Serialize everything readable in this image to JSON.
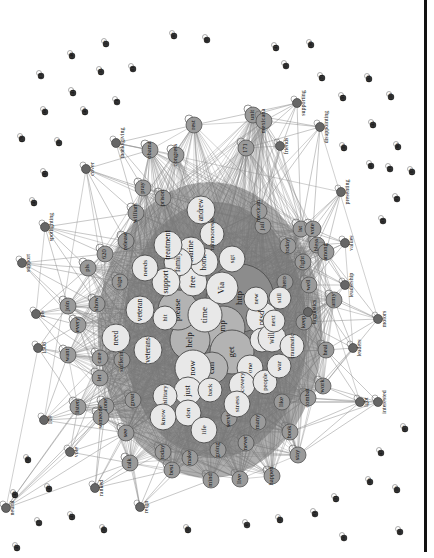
{
  "diagram": {
    "type": "word co-occurrence network",
    "orientation": "rotated 90deg (labels read bottom-to-top)",
    "colors": {
      "edge": "#8a8a8a",
      "hub_dark": "#8c8c8c",
      "hub_mid": "#b3b3b3",
      "light": "#e8e8e8",
      "small": "#9a9a9a",
      "text": "#111111",
      "border": "#111111"
    },
    "core_nodes": [
      {
        "label": "http",
        "x": 240,
        "y": 298,
        "r": 34,
        "shade": "hub_dark"
      },
      {
        "label": "amp",
        "x": 223,
        "y": 328,
        "r": 22,
        "shade": "hub_mid"
      },
      {
        "label": "get",
        "x": 232,
        "y": 352,
        "r": 22,
        "shade": "hub_mid"
      },
      {
        "label": "help",
        "x": 190,
        "y": 340,
        "r": 20,
        "shade": "hub_mid"
      },
      {
        "label": "please",
        "x": 178,
        "y": 310,
        "r": 20,
        "shade": "hub_mid"
      },
      {
        "label": "can",
        "x": 212,
        "y": 368,
        "r": 16,
        "shade": "hub_mid"
      },
      {
        "label": "now",
        "x": 193,
        "y": 368,
        "r": 18,
        "shade": "light"
      },
      {
        "label": "time",
        "x": 205,
        "y": 315,
        "r": 17,
        "shade": "light"
      },
      {
        "label": "Via",
        "x": 222,
        "y": 288,
        "r": 16,
        "shade": "light"
      },
      {
        "label": "free",
        "x": 193,
        "y": 282,
        "r": 14,
        "shade": "light"
      },
      {
        "label": "home",
        "x": 204,
        "y": 262,
        "r": 14,
        "shade": "light"
      },
      {
        "label": "marine",
        "x": 191,
        "y": 251,
        "r": 14,
        "shade": "light"
      },
      {
        "label": "family",
        "x": 178,
        "y": 262,
        "r": 14,
        "shade": "light"
      },
      {
        "label": "support",
        "x": 166,
        "y": 282,
        "r": 14,
        "shade": "light"
      },
      {
        "label": "treatment",
        "x": 168,
        "y": 245,
        "r": 14,
        "shade": "light"
      },
      {
        "label": "andrew",
        "x": 201,
        "y": 210,
        "r": 14,
        "shade": "light"
      },
      {
        "label": "tahmooressi",
        "x": 212,
        "y": 234,
        "r": 12,
        "shade": "light"
      },
      {
        "label": "sgt",
        "x": 232,
        "y": 259,
        "r": 13,
        "shade": "light"
      },
      {
        "label": "hit",
        "x": 165,
        "y": 318,
        "r": 12,
        "shade": "light"
      },
      {
        "label": "veteran",
        "x": 140,
        "y": 310,
        "r": 14,
        "shade": "light"
      },
      {
        "label": "needs",
        "x": 145,
        "y": 268,
        "r": 13,
        "shade": "light"
      },
      {
        "label": "need",
        "x": 116,
        "y": 338,
        "r": 14,
        "shade": "light"
      },
      {
        "label": "veterans",
        "x": 148,
        "y": 350,
        "r": 14,
        "shade": "light"
      },
      {
        "label": "ptsd",
        "x": 262,
        "y": 318,
        "r": 16,
        "shade": "light"
      },
      {
        "label": "new",
        "x": 256,
        "y": 299,
        "r": 12,
        "shade": "light"
      },
      {
        "label": "day",
        "x": 262,
        "y": 340,
        "r": 12,
        "shade": "light"
      },
      {
        "label": "will",
        "x": 272,
        "y": 338,
        "r": 14,
        "shade": "light"
      },
      {
        "label": "one",
        "x": 250,
        "y": 368,
        "r": 13,
        "shade": "light"
      },
      {
        "label": "recovery",
        "x": 242,
        "y": 385,
        "r": 13,
        "shade": "light"
      },
      {
        "label": "just",
        "x": 188,
        "y": 391,
        "r": 14,
        "shade": "light"
      },
      {
        "label": "back",
        "x": 210,
        "y": 390,
        "r": 12,
        "shade": "light"
      },
      {
        "label": "military",
        "x": 165,
        "y": 396,
        "r": 12,
        "shade": "light"
      },
      {
        "label": "don",
        "x": 188,
        "y": 413,
        "r": 13,
        "shade": "light"
      },
      {
        "label": "know",
        "x": 163,
        "y": 417,
        "r": 13,
        "shade": "light"
      },
      {
        "label": "life",
        "x": 204,
        "y": 430,
        "r": 13,
        "shade": "light"
      },
      {
        "label": "stress",
        "x": 237,
        "y": 404,
        "r": 13,
        "shade": "light"
      },
      {
        "label": "people",
        "x": 265,
        "y": 382,
        "r": 12,
        "shade": "light"
      },
      {
        "label": "war",
        "x": 279,
        "y": 366,
        "r": 12,
        "shade": "light"
      },
      {
        "label": "next",
        "x": 274,
        "y": 321,
        "r": 11,
        "shade": "light"
      },
      {
        "label": "still",
        "x": 280,
        "y": 298,
        "r": 11,
        "shade": "light"
      },
      {
        "label": "traumatic",
        "x": 292,
        "y": 346,
        "r": 12,
        "shade": "light"
      }
    ],
    "ring_nodes": [
      {
        "label": "suffering",
        "x": 122,
        "y": 360
      },
      {
        "label": "care",
        "x": 100,
        "y": 358
      },
      {
        "label": "let",
        "x": 100,
        "y": 378
      },
      {
        "label": "great",
        "x": 133,
        "y": 400
      },
      {
        "label": "alone",
        "x": 106,
        "y": 406
      },
      {
        "label": "someone",
        "x": 101,
        "y": 417
      },
      {
        "label": "see",
        "x": 126,
        "y": 433
      },
      {
        "label": "today",
        "x": 163,
        "y": 452
      },
      {
        "label": "best",
        "x": 172,
        "y": 470
      },
      {
        "label": "make",
        "x": 190,
        "y": 458
      },
      {
        "label": "going",
        "x": 218,
        "y": 450
      },
      {
        "label": "never",
        "x": 246,
        "y": 443
      },
      {
        "label": "service",
        "x": 229,
        "y": 418
      },
      {
        "label": "many",
        "x": 258,
        "y": 422
      },
      {
        "label": "like",
        "x": 282,
        "y": 402
      },
      {
        "label": "book",
        "x": 290,
        "y": 432
      },
      {
        "label": "combat",
        "x": 308,
        "y": 398
      },
      {
        "label": "work",
        "x": 323,
        "y": 386
      },
      {
        "label": "keep",
        "x": 304,
        "y": 322
      },
      {
        "label": "well",
        "x": 309,
        "y": 285
      },
      {
        "label": "fight",
        "x": 303,
        "y": 262
      },
      {
        "label": "hero",
        "x": 285,
        "y": 282
      },
      {
        "label": "today",
        "x": 288,
        "y": 246
      },
      {
        "label": "ist",
        "x": 301,
        "y": 229
      },
      {
        "label": "jail",
        "x": 263,
        "y": 226
      },
      {
        "label": "mexican",
        "x": 259,
        "y": 211
      },
      {
        "label": "prison",
        "x": 163,
        "y": 198
      },
      {
        "label": "pray",
        "x": 143,
        "y": 188
      },
      {
        "label": "william",
        "x": 136,
        "y": 213
      },
      {
        "label": "release",
        "x": 126,
        "y": 241
      },
      {
        "label": "620",
        "x": 105,
        "y": 254
      },
      {
        "label": "pls",
        "x": 88,
        "y": 268
      },
      {
        "label": "sign",
        "x": 120,
        "y": 282
      },
      {
        "label": "show",
        "x": 97,
        "y": 304
      },
      {
        "label": "join",
        "x": 68,
        "y": 306
      },
      {
        "label": "every",
        "x": 78,
        "y": 325
      },
      {
        "label": "want",
        "x": 68,
        "y": 355
      },
      {
        "label": "listen",
        "x": 78,
        "y": 407
      },
      {
        "label": "talk",
        "x": 130,
        "y": 463
      },
      {
        "label": "mind",
        "x": 211,
        "y": 480
      },
      {
        "label": "live",
        "x": 240,
        "y": 479
      },
      {
        "label": "happen",
        "x": 272,
        "y": 476
      },
      {
        "label": "stay",
        "x": 298,
        "y": 455
      },
      {
        "label": "heal",
        "x": 326,
        "y": 350
      },
      {
        "label": "army",
        "x": 334,
        "y": 300
      },
      {
        "label": "bless",
        "x": 317,
        "y": 245
      },
      {
        "label": "vote",
        "x": 313,
        "y": 229
      },
      {
        "label": "among",
        "x": 326,
        "y": 252
      },
      {
        "label": "congress",
        "x": 176,
        "y": 155
      },
      {
        "label": "obama",
        "x": 150,
        "y": 150
      },
      {
        "label": "171",
        "x": 246,
        "y": 148
      },
      {
        "label": "unit",
        "x": 253,
        "y": 115
      },
      {
        "label": "rest",
        "x": 194,
        "y": 125
      },
      {
        "label": "mexicana",
        "x": 264,
        "y": 121
      }
    ],
    "outer_nodes": [
      {
        "label": "thanksgiving",
        "x": 116,
        "y": 143
      },
      {
        "label": "cover",
        "x": 86,
        "y": 169
      },
      {
        "label": "spotlighting",
        "x": 45,
        "y": 227
      },
      {
        "label": "support",
        "x": 22,
        "y": 263
      },
      {
        "label": "pls",
        "x": 36,
        "y": 314
      },
      {
        "label": "1508",
        "x": 38,
        "y": 348
      },
      {
        "label": "109",
        "x": 44,
        "y": 420
      },
      {
        "label": "vote",
        "x": 70,
        "y": 452
      },
      {
        "label": "ranked",
        "x": 95,
        "y": 488
      },
      {
        "label": "reign",
        "x": 140,
        "y": 507
      },
      {
        "label": "neural",
        "x": 6,
        "y": 508
      },
      {
        "label": "supporting",
        "x": 297,
        "y": 103
      },
      {
        "label": "disappointing",
        "x": 320,
        "y": 127
      },
      {
        "label": "friends",
        "x": 280,
        "y": 146
      },
      {
        "label": "presenting",
        "x": 341,
        "y": 192
      },
      {
        "label": "values",
        "x": 345,
        "y": 243
      },
      {
        "label": "leadership",
        "x": 345,
        "y": 285
      },
      {
        "label": "linguistics",
        "x": 308,
        "y": 312
      },
      {
        "label": "motors",
        "x": 378,
        "y": 319
      },
      {
        "label": "leaders",
        "x": 353,
        "y": 348
      },
      {
        "label": "interested",
        "x": 378,
        "y": 402
      },
      {
        "label": "lgbt",
        "x": 360,
        "y": 402
      }
    ],
    "isolated_nodes": [
      {
        "label": "107",
        "x": 174,
        "y": 36
      },
      {
        "label": "157",
        "x": 106,
        "y": 44
      },
      {
        "label": "87",
        "x": 207,
        "y": 40
      },
      {
        "label": "141",
        "x": 276,
        "y": 48
      },
      {
        "label": "190",
        "x": 311,
        "y": 45
      },
      {
        "label": "146",
        "x": 72,
        "y": 56
      },
      {
        "label": "135",
        "x": 101,
        "y": 72
      },
      {
        "label": "81",
        "x": 133,
        "y": 69
      },
      {
        "label": "85",
        "x": 286,
        "y": 66
      },
      {
        "label": "171",
        "x": 322,
        "y": 78
      },
      {
        "label": "184",
        "x": 369,
        "y": 79
      },
      {
        "label": "13",
        "x": 41,
        "y": 76
      },
      {
        "label": "141",
        "x": 73,
        "y": 93
      },
      {
        "label": "191",
        "x": 343,
        "y": 98
      },
      {
        "label": "119",
        "x": 391,
        "y": 97
      },
      {
        "label": "166",
        "x": 45,
        "y": 112
      },
      {
        "label": "149",
        "x": 85,
        "y": 112
      },
      {
        "label": "71",
        "x": 117,
        "y": 102
      },
      {
        "label": "139",
        "x": 59,
        "y": 143
      },
      {
        "label": "176",
        "x": 22,
        "y": 139
      },
      {
        "label": "145",
        "x": 373,
        "y": 125
      },
      {
        "label": "181",
        "x": 45,
        "y": 174
      },
      {
        "label": "147",
        "x": 34,
        "y": 203
      },
      {
        "label": "139",
        "x": 344,
        "y": 148
      },
      {
        "label": "180",
        "x": 398,
        "y": 147
      },
      {
        "label": "182",
        "x": 412,
        "y": 172
      },
      {
        "label": "48",
        "x": 371,
        "y": 166
      },
      {
        "label": "91",
        "x": 390,
        "y": 169
      },
      {
        "label": "81",
        "x": 397,
        "y": 199
      },
      {
        "label": "91",
        "x": 383,
        "y": 221
      },
      {
        "label": "130",
        "x": 28,
        "y": 460
      },
      {
        "label": "142",
        "x": 49,
        "y": 489
      },
      {
        "label": "143",
        "x": 15,
        "y": 495
      },
      {
        "label": "17",
        "x": 39,
        "y": 523
      },
      {
        "label": "147",
        "x": 72,
        "y": 517
      },
      {
        "label": "129",
        "x": 104,
        "y": 530
      },
      {
        "label": "118",
        "x": 188,
        "y": 530
      },
      {
        "label": "6",
        "x": 247,
        "y": 525
      },
      {
        "label": "122",
        "x": 280,
        "y": 520
      },
      {
        "label": "131",
        "x": 336,
        "y": 499
      },
      {
        "label": "108",
        "x": 370,
        "y": 482
      },
      {
        "label": "118",
        "x": 397,
        "y": 490
      },
      {
        "label": "66",
        "x": 344,
        "y": 538
      },
      {
        "label": "66",
        "x": 400,
        "y": 532
      },
      {
        "label": "107",
        "x": 405,
        "y": 429
      },
      {
        "label": "47",
        "x": 381,
        "y": 453
      },
      {
        "label": "81",
        "x": 315,
        "y": 514
      },
      {
        "label": "147",
        "x": 17,
        "y": 548
      }
    ]
  }
}
